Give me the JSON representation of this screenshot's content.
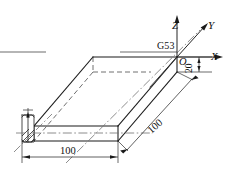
{
  "figure": {
    "type": "isometric-engineering-drawing",
    "title": ""
  },
  "axes": {
    "x_label": "X",
    "y_label": "Y",
    "z_label": "Z",
    "origin_label": "O"
  },
  "annotations": {
    "datum_label": "G53"
  },
  "dimensions": {
    "width": "100",
    "depth": "100",
    "thickness": "20"
  },
  "colors": {
    "stroke": "#1a1a1a",
    "hidden": "#606060",
    "centerline": "#707070",
    "background": "#ffffff"
  }
}
